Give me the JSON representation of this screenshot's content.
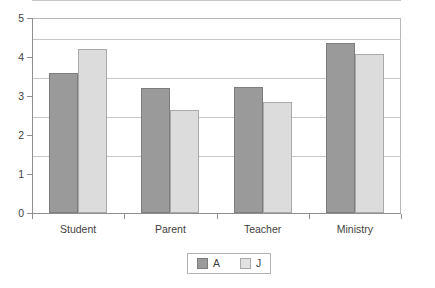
{
  "chart_data": {
    "type": "bar",
    "title": "",
    "subtitle": "",
    "xlabel": "",
    "ylabel": "",
    "categories": [
      "Student",
      "Parent",
      "Teacher",
      "Ministry"
    ],
    "series": [
      {
        "name": "A",
        "color": "#9a9a9a",
        "values": [
          3.6,
          3.2,
          3.22,
          4.37
        ]
      },
      {
        "name": "J",
        "color": "#dcdcdc",
        "values": [
          4.2,
          2.63,
          2.85,
          4.07
        ]
      }
    ],
    "ylim": [
      0,
      5
    ],
    "ytick_labels": [
      "0",
      "1",
      "2",
      "3",
      "4",
      "5"
    ],
    "ytick_values": [
      0,
      1,
      2,
      3,
      4,
      5
    ],
    "grid": true,
    "legend_position": "bottom-center",
    "legend_entries": [
      "A",
      "J"
    ],
    "frame_color": "#b8b8b8",
    "grid_color": "#c6c6c6",
    "axis_color": "#8f8f8f",
    "background": "#ffffff"
  }
}
